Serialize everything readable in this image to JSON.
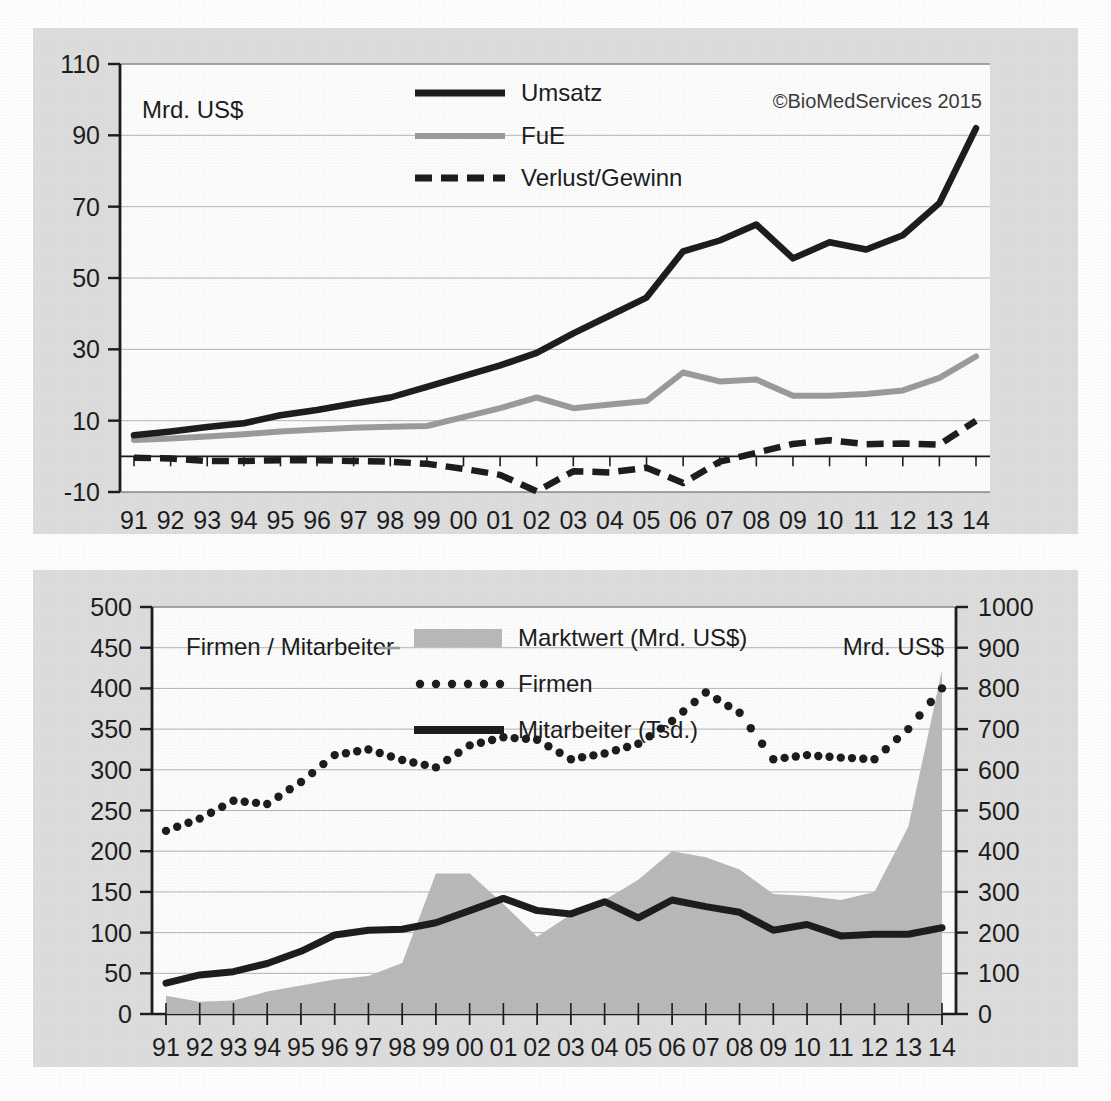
{
  "meta": {
    "credit": "©BioMedServices 2015"
  },
  "chart_data": [
    {
      "id": "top",
      "type": "line",
      "title": "",
      "xlabel": "",
      "ylabel": "Mrd. US$",
      "ylim": [
        -10,
        110
      ],
      "yticks": [
        -10,
        10,
        30,
        50,
        70,
        90,
        110
      ],
      "grid": true,
      "legend_position": "top-center",
      "categories": [
        "91",
        "92",
        "93",
        "94",
        "95",
        "96",
        "97",
        "98",
        "99",
        "00",
        "01",
        "02",
        "03",
        "04",
        "05",
        "06",
        "07",
        "08",
        "09",
        "10",
        "11",
        "12",
        "13",
        "14"
      ],
      "series": [
        {
          "name": "Umsatz",
          "style": "solid-black",
          "values": [
            5.9,
            7.0,
            8.2,
            9.3,
            11.5,
            13.0,
            14.8,
            16.5,
            19.5,
            22.5,
            25.5,
            29.0,
            34.5,
            39.5,
            44.5,
            57.5,
            60.5,
            65.0,
            55.5,
            60.0,
            58.0,
            62.0,
            71.0,
            92.0
          ]
        },
        {
          "name": "FuE",
          "style": "solid-gray",
          "values": [
            4.6,
            5.0,
            5.6,
            6.2,
            7.0,
            7.5,
            8.0,
            8.3,
            8.5,
            11.0,
            13.5,
            16.5,
            13.5,
            14.5,
            15.5,
            23.5,
            21.0,
            21.5,
            17.0,
            17.0,
            17.5,
            18.5,
            22.0,
            28.0
          ]
        },
        {
          "name": "Verlust/Gewinn",
          "style": "dashed-black",
          "values": [
            -0.4,
            -0.6,
            -1.3,
            -1.3,
            -1.1,
            -1.1,
            -1.3,
            -1.5,
            -2.1,
            -3.5,
            -5.2,
            -9.8,
            -4.2,
            -4.5,
            -3.2,
            -7.5,
            -1.5,
            1.0,
            3.5,
            4.5,
            3.4,
            3.6,
            3.3,
            10.0
          ]
        }
      ],
      "legend": [
        "Umsatz",
        "FuE",
        "Verlust/Gewinn"
      ]
    },
    {
      "id": "bottom",
      "type": "area",
      "title": "",
      "xlabel": "",
      "ylabel_left": "Firmen / Mitarbeiter",
      "ylabel_right": "Mrd. US$",
      "ylim_left": [
        0,
        500
      ],
      "yticks_left": [
        0,
        50,
        100,
        150,
        200,
        250,
        300,
        350,
        400,
        450,
        500
      ],
      "ylim_right": [
        0,
        1000
      ],
      "yticks_right": [
        0,
        100,
        200,
        300,
        400,
        500,
        600,
        700,
        800,
        900,
        1000
      ],
      "grid": true,
      "legend_position": "top-center",
      "categories": [
        "91",
        "92",
        "93",
        "94",
        "95",
        "96",
        "97",
        "98",
        "99",
        "00",
        "01",
        "02",
        "03",
        "04",
        "05",
        "06",
        "07",
        "08",
        "09",
        "10",
        "11",
        "12",
        "13",
        "14"
      ],
      "series": [
        {
          "name": "Marktwert (Mrd. US$)",
          "style": "area-gray",
          "axis": "right",
          "values": [
            45,
            30,
            33,
            55,
            70,
            85,
            93,
            125,
            345,
            345,
            270,
            190,
            245,
            280,
            330,
            400,
            385,
            355,
            295,
            290,
            280,
            300,
            460,
            845
          ]
        },
        {
          "name": "Firmen",
          "style": "dotted-black",
          "axis": "left",
          "values": [
            225,
            240,
            262,
            258,
            285,
            318,
            325,
            312,
            303,
            330,
            340,
            337,
            313,
            320,
            332,
            360,
            395,
            370,
            313,
            318,
            315,
            313,
            350,
            400
          ]
        },
        {
          "name": "Mitarbeiter (Tsd.)",
          "style": "solid-black",
          "axis": "left",
          "values": [
            38,
            48,
            52,
            62,
            77,
            97,
            103,
            104,
            112,
            127,
            142,
            127,
            123,
            138,
            118,
            140,
            132,
            125,
            103,
            110,
            96,
            98,
            98,
            106
          ]
        }
      ],
      "legend": [
        "Marktwert (Mrd. US$)",
        "Firmen",
        "Mitarbeiter (Tsd.)"
      ]
    }
  ],
  "colors": {
    "panel_bg": "#dcdcdc",
    "plot_bg": "#fbfbfb",
    "series_black": "#1c1c1c",
    "series_gray": "#9a9a9a",
    "area_gray": "#b8b8b8",
    "grid": "#b0b0b0",
    "axis": "#1c1c1c"
  }
}
